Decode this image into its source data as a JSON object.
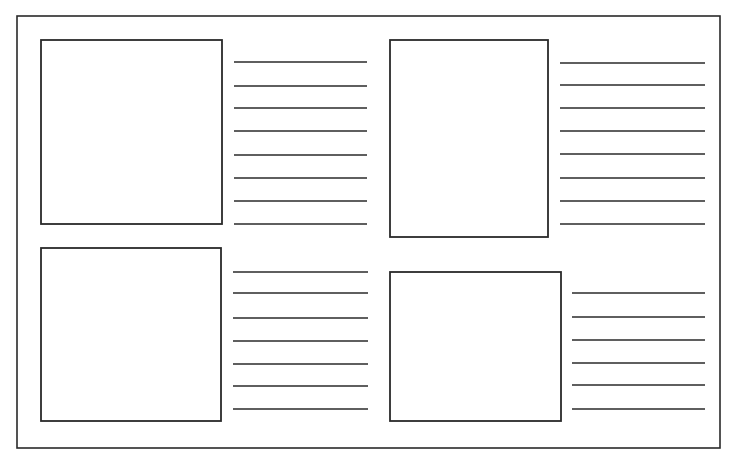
{
  "diagram": {
    "stroke_color": "#2a2a2a",
    "background": "#ffffff",
    "frame": {
      "x": 17,
      "y": 16,
      "w": 703,
      "h": 432
    },
    "panels": [
      {
        "name": "top-left",
        "box": {
          "x": 41,
          "y": 40,
          "w": 181,
          "h": 184
        },
        "lines": {
          "x1": 234,
          "x2": 367,
          "ys": [
            62,
            86,
            108,
            131,
            155,
            178,
            201,
            224
          ]
        }
      },
      {
        "name": "top-right",
        "box": {
          "x": 390,
          "y": 40,
          "w": 158,
          "h": 197
        },
        "lines": {
          "x1": 560,
          "x2": 705,
          "ys": [
            63,
            85,
            108,
            131,
            154,
            178,
            201,
            224
          ]
        }
      },
      {
        "name": "bottom-left",
        "box": {
          "x": 41,
          "y": 248,
          "w": 180,
          "h": 173
        },
        "lines": {
          "x1": 233,
          "x2": 368,
          "ys": [
            272,
            293,
            318,
            341,
            364,
            386,
            409
          ]
        }
      },
      {
        "name": "bottom-right",
        "box": {
          "x": 390,
          "y": 272,
          "w": 171,
          "h": 149
        },
        "lines": {
          "x1": 572,
          "x2": 705,
          "ys": [
            293,
            317,
            340,
            363,
            385,
            409
          ]
        }
      }
    ]
  }
}
